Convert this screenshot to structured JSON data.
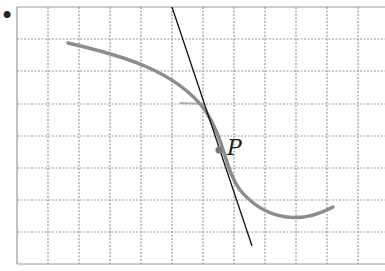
{
  "figure": {
    "bullet": "•",
    "point_label": "P",
    "colors": {
      "grid": "#9a9a9a",
      "curve": "#8c8c8c",
      "tangent": "#111111",
      "point": "#7a7a7a",
      "bullet": "#111111"
    },
    "grid": {
      "x_lines": [
        17,
        48,
        79,
        110,
        141,
        172,
        203,
        234,
        265,
        296,
        327,
        358
      ],
      "y_lines": [
        7,
        39,
        71,
        104,
        136,
        168,
        200,
        232,
        264
      ],
      "right_edge": 385
    },
    "curve_points": "M68,43 C120,55 175,70 205,110 C225,140 225,170 240,190 C265,220 300,225 333,207",
    "tangent_line": {
      "x1": 172,
      "y1": 7,
      "x2": 252,
      "y2": 246
    },
    "point_P": {
      "x": 219,
      "y": 150
    },
    "short_mark": {
      "x1": 180,
      "y1": 103,
      "x2": 205,
      "y2": 104
    }
  }
}
